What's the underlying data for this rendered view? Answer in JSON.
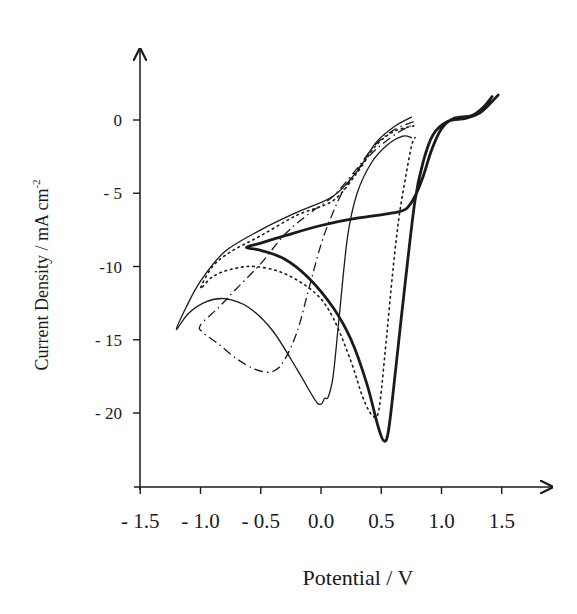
{
  "chart_data": {
    "type": "line",
    "title": "",
    "xlabel": "Potential / V",
    "ylabel": "Current Density / mA cm",
    "ylabel_superscript": "-2",
    "xlim": [
      -1.5,
      1.85
    ],
    "ylim": [
      -25.5,
      5
    ],
    "grid": false,
    "legend": "none",
    "x_ticks": [
      -1.5,
      -1.0,
      -0.5,
      0.0,
      0.5,
      1.0,
      1.5
    ],
    "x_tick_labels": [
      "- 1.5",
      "- 1.0",
      "- 0.5",
      "0.0",
      "0.5",
      "1.0",
      "1.5"
    ],
    "y_ticks": [
      0,
      -5,
      -10,
      -15,
      -20
    ],
    "y_tick_labels": [
      "0",
      "- 5",
      "-10",
      "- 15",
      "- 20"
    ],
    "series": [
      {
        "name": "thin-solid",
        "style": "solid",
        "width": 1.3,
        "points": [
          [
            0.75,
            0.2
          ],
          [
            0.6,
            -0.5
          ],
          [
            0.45,
            -1.6
          ],
          [
            0.3,
            -3.5
          ],
          [
            0.1,
            -5.2
          ],
          [
            -0.2,
            -6.3
          ],
          [
            -0.5,
            -7.5
          ],
          [
            -0.8,
            -9.0
          ],
          [
            -1.0,
            -11.0
          ],
          [
            -1.12,
            -12.8
          ],
          [
            -1.2,
            -14.3
          ],
          [
            -1.1,
            -13.2
          ],
          [
            -0.95,
            -12.4
          ],
          [
            -0.8,
            -12.2
          ],
          [
            -0.6,
            -12.8
          ],
          [
            -0.4,
            -14.4
          ],
          [
            -0.2,
            -17.0
          ],
          [
            -0.05,
            -19.1
          ],
          [
            0.0,
            -19.4
          ],
          [
            0.03,
            -19.0
          ],
          [
            0.06,
            -18.9
          ],
          [
            0.1,
            -17.5
          ],
          [
            0.15,
            -13.5
          ],
          [
            0.22,
            -8.0
          ],
          [
            0.3,
            -5.0
          ],
          [
            0.42,
            -2.9
          ],
          [
            0.55,
            -1.7
          ],
          [
            0.68,
            -1.1
          ],
          [
            0.75,
            -1.2
          ]
        ]
      },
      {
        "name": "dotted",
        "style": "dotted",
        "width": 1.6,
        "points": [
          [
            0.77,
            -0.4
          ],
          [
            0.6,
            -0.8
          ],
          [
            0.45,
            -1.8
          ],
          [
            0.3,
            -3.6
          ],
          [
            0.1,
            -5.5
          ],
          [
            -0.2,
            -6.5
          ],
          [
            -0.5,
            -7.9
          ],
          [
            -0.75,
            -9.0
          ],
          [
            -0.9,
            -10.0
          ],
          [
            -1.0,
            -11.5
          ],
          [
            -0.9,
            -10.7
          ],
          [
            -0.75,
            -10.2
          ],
          [
            -0.55,
            -10.0
          ],
          [
            -0.3,
            -10.5
          ],
          [
            -0.05,
            -11.8
          ],
          [
            0.1,
            -13.5
          ],
          [
            0.25,
            -16.5
          ],
          [
            0.35,
            -19.0
          ],
          [
            0.43,
            -20.2
          ],
          [
            0.48,
            -19.8
          ],
          [
            0.53,
            -16.0
          ],
          [
            0.6,
            -10.0
          ],
          [
            0.65,
            -6.5
          ],
          [
            0.7,
            -4.0
          ],
          [
            0.75,
            -1.8
          ],
          [
            0.78,
            -1.2
          ]
        ]
      },
      {
        "name": "dash-dot",
        "style": "dashdot",
        "width": 1.3,
        "points": [
          [
            0.77,
            -0.1
          ],
          [
            0.6,
            -0.7
          ],
          [
            0.45,
            -1.7
          ],
          [
            0.3,
            -3.3
          ],
          [
            0.1,
            -5.2
          ],
          [
            -0.1,
            -6.4
          ],
          [
            -0.3,
            -7.8
          ],
          [
            -0.5,
            -9.8
          ],
          [
            -0.7,
            -11.5
          ],
          [
            -0.85,
            -12.8
          ],
          [
            -1.0,
            -14.0
          ],
          [
            -0.98,
            -14.5
          ],
          [
            -0.85,
            -15.3
          ],
          [
            -0.7,
            -16.3
          ],
          [
            -0.55,
            -17.0
          ],
          [
            -0.42,
            -17.2
          ],
          [
            -0.32,
            -16.6
          ],
          [
            -0.2,
            -14.5
          ],
          [
            -0.1,
            -11.5
          ],
          [
            0.0,
            -8.5
          ],
          [
            0.1,
            -6.3
          ],
          [
            0.2,
            -4.6
          ],
          [
            0.35,
            -2.9
          ],
          [
            0.5,
            -1.7
          ],
          [
            0.65,
            -0.8
          ],
          [
            0.77,
            -0.3
          ]
        ]
      },
      {
        "name": "thick-solid",
        "style": "solid",
        "width": 2.8,
        "points": [
          [
            1.42,
            1.6
          ],
          [
            1.35,
            0.9
          ],
          [
            1.25,
            0.3
          ],
          [
            1.1,
            0.1
          ],
          [
            1.0,
            -0.6
          ],
          [
            0.92,
            -2.0
          ],
          [
            0.85,
            -3.8
          ],
          [
            0.78,
            -5.2
          ],
          [
            0.7,
            -6.1
          ],
          [
            0.55,
            -6.4
          ],
          [
            0.3,
            -6.7
          ],
          [
            0.0,
            -7.2
          ],
          [
            -0.3,
            -7.9
          ],
          [
            -0.5,
            -8.4
          ],
          [
            -0.62,
            -8.7
          ],
          [
            -0.5,
            -8.9
          ],
          [
            -0.3,
            -9.5
          ],
          [
            -0.1,
            -10.8
          ],
          [
            0.1,
            -12.8
          ],
          [
            0.25,
            -15.0
          ],
          [
            0.38,
            -18.0
          ],
          [
            0.47,
            -20.8
          ],
          [
            0.52,
            -21.9
          ],
          [
            0.56,
            -21.2
          ],
          [
            0.62,
            -17.0
          ],
          [
            0.7,
            -11.0
          ],
          [
            0.78,
            -5.5
          ],
          [
            0.85,
            -2.8
          ],
          [
            0.93,
            -1.0
          ],
          [
            1.05,
            -0.1
          ],
          [
            1.2,
            0.1
          ],
          [
            1.32,
            0.5
          ],
          [
            1.4,
            1.1
          ],
          [
            1.47,
            1.7
          ]
        ]
      }
    ]
  }
}
